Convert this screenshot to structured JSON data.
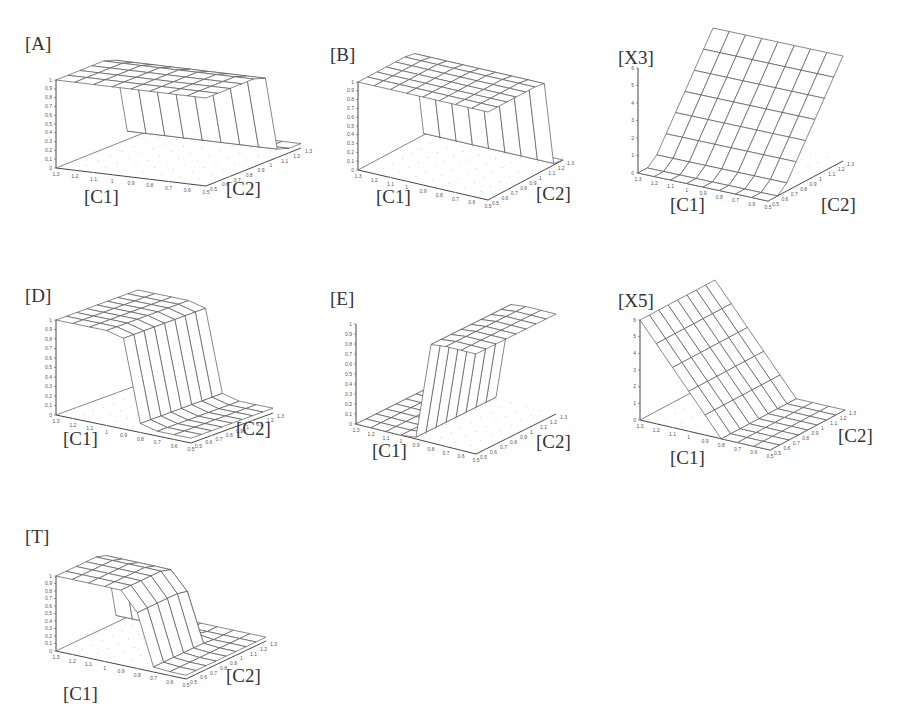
{
  "figure": {
    "panels": [
      {
        "id": "A",
        "label": "[A]",
        "zlabel_ticks": [
          "0",
          "0.1",
          "0.2",
          "0.3",
          "0.4",
          "0.5",
          "0.6",
          "0.7",
          "0.8",
          "0.9",
          "1"
        ],
        "x_label": "[C1]",
        "y_label": "[C2]"
      },
      {
        "id": "B",
        "label": "[B]",
        "zlabel_ticks": [
          "0",
          "0.1",
          "0.2",
          "0.3",
          "0.4",
          "0.5",
          "0.6",
          "0.7",
          "0.8",
          "0.9",
          "1"
        ],
        "x_label": "[C1]",
        "y_label": "[C2]"
      },
      {
        "id": "X3",
        "label": "[X3]",
        "zlabel_ticks": [
          "0",
          "1",
          "2",
          "3",
          "4",
          "5",
          "6"
        ],
        "x_label": "[C1]",
        "y_label": "[C2]"
      },
      {
        "id": "D",
        "label": "[D]",
        "zlabel_ticks": [
          "0",
          "0.1",
          "0.2",
          "0.3",
          "0.4",
          "0.5",
          "0.6",
          "0.7",
          "0.8",
          "0.9",
          "1"
        ],
        "x_label": "[C1]",
        "y_label": "[C2]"
      },
      {
        "id": "E",
        "label": "[E]",
        "zlabel_ticks": [
          "0",
          "0.1",
          "0.2",
          "0.3",
          "0.4",
          "0.5",
          "0.6",
          "0.7",
          "0.8",
          "0.9",
          "1"
        ],
        "x_label": "[C1]",
        "y_label": "[C2]"
      },
      {
        "id": "X5",
        "label": "[X5]",
        "zlabel_ticks": [
          "0",
          "1",
          "2",
          "3",
          "4",
          "5",
          "6"
        ],
        "x_label": "[C1]",
        "y_label": "[C2]"
      },
      {
        "id": "T",
        "label": "[T]",
        "zlabel_ticks": [
          "0",
          "0.1",
          "0.2",
          "0.3",
          "0.4",
          "0.5",
          "0.6",
          "0.7",
          "0.8",
          "0.9",
          "1"
        ],
        "x_label": "[C1]",
        "y_label": "[C2]"
      }
    ]
  },
  "chart_data": [
    {
      "type": "surface",
      "title": "[A]",
      "xlabel": "[C1]",
      "ylabel": "[C2]",
      "x_ticks": [
        "1.3",
        "1.2",
        "1.1",
        "1",
        "0.9",
        "0.8",
        "0.7",
        "0.6",
        "0.5"
      ],
      "y_ticks": [
        "0.5",
        "0.6",
        "0.7",
        "0.8",
        "0.9",
        "1",
        "1.1",
        "1.2",
        "1.3"
      ],
      "zlim": [
        0,
        1
      ],
      "shape": "step_down_in_C1",
      "low": 0.05,
      "high": 1.0,
      "step_at_C1": 0.95,
      "description": "A ~1 for C1 > ~1, drops to ~0 for low C1; independent of C2"
    },
    {
      "type": "surface",
      "title": "[B]",
      "xlabel": "[C1]",
      "ylabel": "[C2]",
      "x_ticks": [
        "1.3",
        "1.2",
        "1.1",
        "1",
        "0.9",
        "0.8",
        "0.7",
        "0.6",
        "0.5"
      ],
      "y_ticks": [
        "0.5",
        "0.6",
        "0.7",
        "0.8",
        "0.9",
        "1",
        "1.1",
        "1.2",
        "1.3"
      ],
      "zlim": [
        0,
        1
      ],
      "shape": "step_in_C2",
      "low": 0.0,
      "high": 1.0,
      "step_at_C2": 1.0,
      "description": "B ~1 for low C2, drops to ~0 for high C2"
    },
    {
      "type": "surface",
      "title": "[X3]",
      "xlabel": "[C1]",
      "ylabel": "[C2]",
      "x_ticks": [
        "1.3",
        "1.2",
        "1.1",
        "1",
        "0.9",
        "0.8",
        "0.7",
        "0.6",
        "0.5"
      ],
      "y_ticks": [
        "0.5",
        "0.6",
        "0.7",
        "0.8",
        "0.9",
        "1",
        "1.1",
        "1.2",
        "1.3"
      ],
      "zlim": [
        0,
        6
      ],
      "shape": "ramp_in_C2",
      "low": 0.0,
      "high": 6.0,
      "description": "X3 ~0 at low C2, rises roughly linearly to ~6 at high C2"
    },
    {
      "type": "surface",
      "title": "[D]",
      "xlabel": "[C1]",
      "ylabel": "[C2]",
      "x_ticks": [
        "1.3",
        "1.2",
        "1.1",
        "1",
        "0.9",
        "0.8",
        "0.7",
        "0.6",
        "0.5"
      ],
      "y_ticks": [
        "0.5",
        "0.6",
        "0.7",
        "0.8",
        "0.9",
        "1",
        "1.1",
        "1.2",
        "1.3"
      ],
      "zlim": [
        0,
        1
      ],
      "shape": "step_down_in_C1_high_first",
      "low": 0.05,
      "high": 1.0,
      "description": "D ~1 for high C1, drops to ~0 for low C1"
    },
    {
      "type": "surface",
      "title": "[E]",
      "xlabel": "[C1]",
      "ylabel": "[C2]",
      "x_ticks": [
        "1.3",
        "1.2",
        "1.1",
        "1",
        "0.9",
        "0.8",
        "0.7",
        "0.6",
        "0.5"
      ],
      "y_ticks": [
        "0.5",
        "0.6",
        "0.7",
        "0.8",
        "0.9",
        "1",
        "1.1",
        "1.2",
        "1.3"
      ],
      "zlim": [
        0,
        1
      ],
      "shape": "step_up_in_C2",
      "low": 0.0,
      "high": 1.0,
      "description": "E ~0 for low C2, rises to ~1 for high C2"
    },
    {
      "type": "surface",
      "title": "[X5]",
      "xlabel": "[C1]",
      "ylabel": "[C2]",
      "x_ticks": [
        "1.3",
        "1.2",
        "1.1",
        "1",
        "0.9",
        "0.8",
        "0.7",
        "0.6",
        "0.5"
      ],
      "y_ticks": [
        "0.5",
        "0.6",
        "0.7",
        "0.8",
        "0.9",
        "1",
        "1.1",
        "1.2",
        "1.3"
      ],
      "zlim": [
        0,
        6
      ],
      "shape": "ramp_down_in_C1",
      "low": 0.0,
      "high": 6.0,
      "description": "X5 ~6 at high C1, decreases linearly to ~0 around C1 = 0.8"
    },
    {
      "type": "surface",
      "title": "[T]",
      "xlabel": "[C1]",
      "ylabel": "[C2]",
      "x_ticks": [
        "1.3",
        "1.2",
        "1.1",
        "1",
        "0.9",
        "0.8",
        "0.7",
        "0.6",
        "0.5"
      ],
      "y_ticks": [
        "0.5",
        "0.6",
        "0.7",
        "0.8",
        "0.9",
        "1",
        "1.1",
        "1.2",
        "1.3"
      ],
      "zlim": [
        0,
        1
      ],
      "shape": "plateau",
      "low": 0.05,
      "high": 1.0,
      "description": "T ~1 in an intermediate region (high C1, low C2), ~0 elsewhere"
    }
  ]
}
